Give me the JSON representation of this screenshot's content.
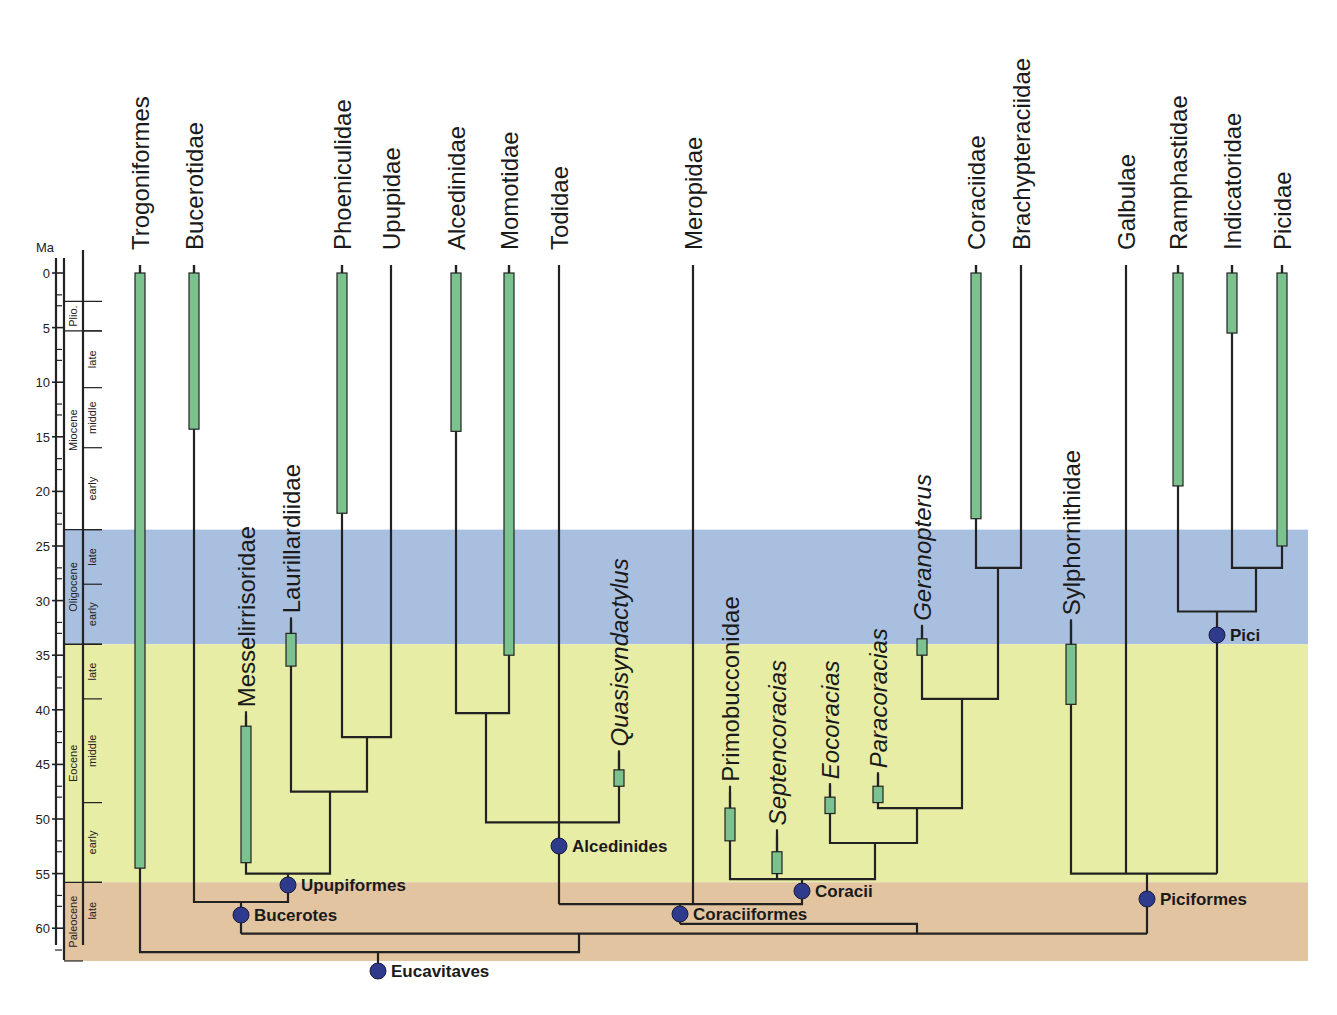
{
  "chart_data": {
    "type": "phylogeny_timetree",
    "title": "",
    "ylabel": "Ma",
    "ylim": [
      0,
      63
    ],
    "y_ticks": [
      0,
      5,
      10,
      15,
      20,
      25,
      30,
      35,
      40,
      45,
      50,
      55,
      60
    ],
    "epochs": [
      {
        "name": "Plio.",
        "start": 2.6,
        "end": 5.3,
        "subdivisions": []
      },
      {
        "name": "Miocene",
        "start": 5.3,
        "end": 23.5,
        "subdivisions": [
          {
            "name": "late",
            "start": 5.3,
            "end": 10.5
          },
          {
            "name": "middle",
            "start": 10.5,
            "end": 16
          },
          {
            "name": "early",
            "start": 16,
            "end": 23.5
          }
        ]
      },
      {
        "name": "Oligocene",
        "start": 23.5,
        "end": 34,
        "subdivisions": [
          {
            "name": "late",
            "start": 23.5,
            "end": 28.5
          },
          {
            "name": "early",
            "start": 28.5,
            "end": 34
          }
        ]
      },
      {
        "name": "Eocene",
        "start": 34,
        "end": 55.8,
        "subdivisions": [
          {
            "name": "late",
            "start": 34,
            "end": 39
          },
          {
            "name": "middle",
            "start": 39,
            "end": 48.5
          },
          {
            "name": "early",
            "start": 48.5,
            "end": 55.8
          }
        ]
      },
      {
        "name": "Paleocene",
        "start": 55.8,
        "end": 63,
        "subdivisions": [
          {
            "name": "late",
            "start": 55.8,
            "end": 61
          }
        ]
      }
    ],
    "background_bands": [
      {
        "epoch": "Oligocene",
        "from": 23.5,
        "to": 34,
        "color": "#a9bfe0"
      },
      {
        "epoch": "Eocene",
        "from": 34,
        "to": 55.8,
        "color": "#e8eda6"
      },
      {
        "epoch": "Paleocene",
        "from": 55.8,
        "to": 63,
        "color": "#e2c4a0"
      }
    ],
    "taxa": [
      {
        "name": "Trogoniformes",
        "italic": false,
        "x": 140,
        "fossil_range": [
          0,
          54.5
        ]
      },
      {
        "name": "Bucerotidae",
        "italic": false,
        "x": 194,
        "fossil_range": [
          0,
          14.3
        ]
      },
      {
        "name": "Messelirrisoridae",
        "italic": false,
        "x": 246,
        "fossil_range": [
          41.5,
          54
        ]
      },
      {
        "name": "Laurillardiidae",
        "italic": false,
        "x": 291,
        "fossil_range": [
          33,
          36
        ]
      },
      {
        "name": "Phoeniculidae",
        "italic": false,
        "x": 342,
        "fossil_range": [
          0,
          22
        ]
      },
      {
        "name": "Upupidae",
        "italic": false,
        "x": 391,
        "fossil_range": null
      },
      {
        "name": "Alcedinidae",
        "italic": false,
        "x": 456,
        "fossil_range": [
          0,
          14.5
        ]
      },
      {
        "name": "Momotidae",
        "italic": false,
        "x": 509,
        "fossil_range": [
          0,
          35
        ]
      },
      {
        "name": "Todidae",
        "italic": false,
        "x": 559,
        "fossil_range": null
      },
      {
        "name": "Quasisyndactylus",
        "italic": true,
        "x": 619,
        "fossil_range": [
          45.5,
          47
        ]
      },
      {
        "name": "Meropidae",
        "italic": false,
        "x": 693,
        "fossil_range": null
      },
      {
        "name": "Primobucconidae",
        "italic": false,
        "x": 730,
        "fossil_range": [
          49,
          52
        ]
      },
      {
        "name": "Septencoracias",
        "italic": true,
        "x": 777,
        "fossil_range": [
          53,
          55
        ]
      },
      {
        "name": "Eocoracias",
        "italic": true,
        "x": 830,
        "fossil_range": [
          48,
          49.5
        ]
      },
      {
        "name": "Paracoracias",
        "italic": true,
        "x": 878,
        "fossil_range": [
          47,
          48.5
        ]
      },
      {
        "name": "Geranopterus",
        "italic": true,
        "x": 922,
        "fossil_range": [
          33.5,
          35
        ]
      },
      {
        "name": "Coraciidae",
        "italic": false,
        "x": 976,
        "fossil_range": [
          0,
          22.5
        ]
      },
      {
        "name": "Brachypteraciidae",
        "italic": false,
        "x": 1021,
        "fossil_range": null
      },
      {
        "name": "Sylphornithidae",
        "italic": false,
        "x": 1071,
        "fossil_range": [
          34,
          39.5
        ]
      },
      {
        "name": "Galbulae",
        "italic": false,
        "x": 1126,
        "fossil_range": null
      },
      {
        "name": "Ramphastidae",
        "italic": false,
        "x": 1178,
        "fossil_range": [
          0,
          19.5
        ]
      },
      {
        "name": "Indicatoridae",
        "italic": false,
        "x": 1232,
        "fossil_range": [
          0,
          5.5
        ]
      },
      {
        "name": "Picidae",
        "italic": false,
        "x": 1282,
        "fossil_range": [
          0,
          25
        ]
      }
    ],
    "named_nodes": [
      {
        "name": "Eucavitaves",
        "age": 63.5
      },
      {
        "name": "Bucerotes",
        "age": 58.6
      },
      {
        "name": "Upupiformes",
        "age": 56.3
      },
      {
        "name": "Alcedinides",
        "age": 52.5
      },
      {
        "name": "Coracii",
        "age": 56.8
      },
      {
        "name": "Coraciiformes",
        "age": 58.8
      },
      {
        "name": "Piciformes",
        "age": 57.5
      },
      {
        "name": "Pici",
        "age": 33.5
      }
    ],
    "annotations": [
      "Ma"
    ]
  },
  "axis": {
    "unit_label": "Ma"
  }
}
